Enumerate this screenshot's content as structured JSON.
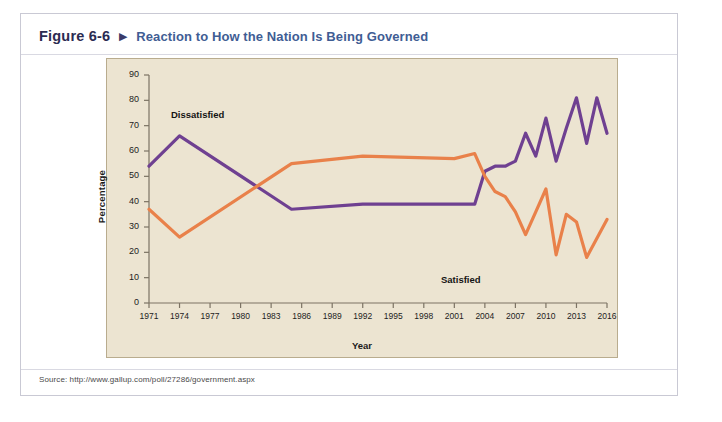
{
  "figure": {
    "number": "Figure 6-6",
    "arrow": "▶",
    "title": "Reaction to How the Nation Is Being Governed",
    "source": "Source: http://www.gallup.com/poll/27286/government.aspx"
  },
  "colors": {
    "dissatisfied": "#6f4091",
    "satisfied": "#e9814a",
    "panel_background": "#ece4d1",
    "panel_border": "#b9ac8e",
    "card_border": "#c9c9d4",
    "title_blue": "#3f5d94",
    "figure_number": "#2b2b52"
  },
  "chart_data": {
    "type": "line",
    "title": "Reaction to How the Nation Is Being Governed",
    "xlabel": "Year",
    "ylabel": "Percentage",
    "xlim": [
      1971,
      2016
    ],
    "ylim": [
      0,
      90
    ],
    "ytick_values": [
      0,
      10,
      20,
      30,
      40,
      50,
      60,
      70,
      80,
      90
    ],
    "xtick_labels": [
      "1971",
      "1974",
      "1977",
      "1980",
      "1983",
      "1986",
      "1989",
      "1992",
      "1995",
      "1998",
      "2001",
      "2004",
      "2007",
      "2010",
      "2013",
      "2016"
    ],
    "xtick_values": [
      1971,
      1974,
      1977,
      1980,
      1983,
      1986,
      1989,
      1992,
      1995,
      1998,
      2001,
      2004,
      2007,
      2010,
      2013,
      2016
    ],
    "grid": false,
    "legend": "inline-annotations",
    "annotations": [
      {
        "text": "Dissatisfied",
        "x": 1975.5,
        "y": 74
      },
      {
        "text": "Satisfied",
        "x": 2006.5,
        "y": 20
      }
    ],
    "series": [
      {
        "name": "Dissatisfied",
        "color": "#6f4091",
        "points": [
          {
            "x": 1971,
            "y": 54
          },
          {
            "x": 1974,
            "y": 66
          },
          {
            "x": 1985,
            "y": 37
          },
          {
            "x": 1992,
            "y": 39
          },
          {
            "x": 2001,
            "y": 39
          },
          {
            "x": 2003,
            "y": 39
          },
          {
            "x": 2004,
            "y": 52
          },
          {
            "x": 2005,
            "y": 54
          },
          {
            "x": 2006,
            "y": 54
          },
          {
            "x": 2007,
            "y": 56
          },
          {
            "x": 2008,
            "y": 67
          },
          {
            "x": 2009,
            "y": 58
          },
          {
            "x": 2010,
            "y": 73
          },
          {
            "x": 2011,
            "y": 56
          },
          {
            "x": 2012,
            "y": 69
          },
          {
            "x": 2013,
            "y": 81
          },
          {
            "x": 2014,
            "y": 63
          },
          {
            "x": 2015,
            "y": 81
          },
          {
            "x": 2016,
            "y": 67
          }
        ]
      },
      {
        "name": "Satisfied",
        "color": "#e9814a",
        "points": [
          {
            "x": 1971,
            "y": 37
          },
          {
            "x": 1974,
            "y": 26
          },
          {
            "x": 1985,
            "y": 55
          },
          {
            "x": 1992,
            "y": 58
          },
          {
            "x": 2001,
            "y": 57
          },
          {
            "x": 2003,
            "y": 59
          },
          {
            "x": 2004,
            "y": 50
          },
          {
            "x": 2005,
            "y": 44
          },
          {
            "x": 2006,
            "y": 42
          },
          {
            "x": 2007,
            "y": 36
          },
          {
            "x": 2008,
            "y": 27
          },
          {
            "x": 2009,
            "y": 36
          },
          {
            "x": 2010,
            "y": 45
          },
          {
            "x": 2011,
            "y": 19
          },
          {
            "x": 2012,
            "y": 35
          },
          {
            "x": 2013,
            "y": 32
          },
          {
            "x": 2014,
            "y": 18
          },
          {
            "x": 2016,
            "y": 33
          }
        ]
      }
    ]
  }
}
